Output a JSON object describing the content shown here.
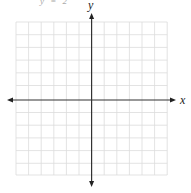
{
  "header": {
    "cropped_text": "y = 2"
  },
  "graph": {
    "x_label": "x",
    "y_label": "y",
    "grid_color": "#dcdcdc",
    "axis_color": "#222222",
    "cells_x": 12,
    "cells_y": 12
  }
}
